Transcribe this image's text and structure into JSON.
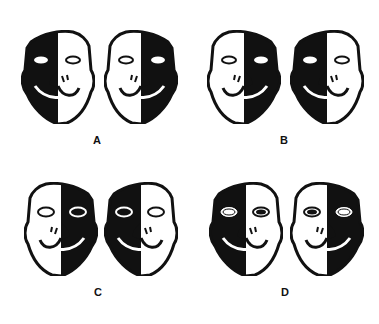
{
  "figure": {
    "panels": [
      {
        "id": "A",
        "label": "A",
        "left_mask": {
          "black_side": "left",
          "eye_style": "plain"
        },
        "right_mask": {
          "black_side": "right",
          "eye_style": "plain"
        }
      },
      {
        "id": "B",
        "label": "B",
        "left_mask": {
          "black_side": "right",
          "eye_style": "plain"
        },
        "right_mask": {
          "black_side": "left",
          "eye_style": "plain"
        }
      },
      {
        "id": "C",
        "label": "C",
        "left_mask": {
          "black_side": "right",
          "eye_style": "ringed"
        },
        "right_mask": {
          "black_side": "left",
          "eye_style": "ringed"
        }
      },
      {
        "id": "D",
        "label": "D",
        "left_mask": {
          "black_side": "left",
          "eye_style": "ringed"
        },
        "right_mask": {
          "black_side": "right",
          "eye_style": "ringed"
        }
      }
    ],
    "colors": {
      "ink": "#111111",
      "paper": "#ffffff"
    }
  }
}
